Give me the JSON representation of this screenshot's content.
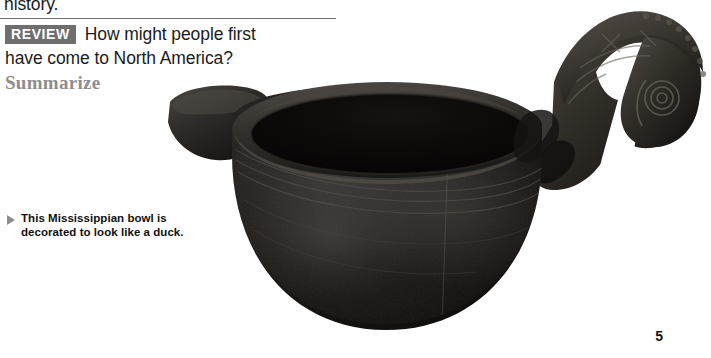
{
  "page": {
    "background_color": "#ffffff",
    "folio": "5"
  },
  "body_text": {
    "clipped_line": "history."
  },
  "review": {
    "badge_label": "REVIEW",
    "badge_bg": "#6e6e6e",
    "badge_text_color": "#ffffff",
    "question_line_1": "How might people first",
    "question_line_2": "have come to North America?",
    "skill_label": "Summarize",
    "skill_color": "#8e8e8e",
    "rule_color": "#6f6f6f"
  },
  "caption": {
    "marker": "triangle-right-icon",
    "marker_color": "#8d8d8d",
    "line_1": "This Mississippian bowl is",
    "line_2": "decorated to look like a duck."
  },
  "photo": {
    "subject": "mississippian-duck-effigy-bowl",
    "alt": "Dark ceramic Mississippian bowl with a carved duck head handle and a flat tail lug",
    "body_color": "#161616",
    "interior_color": "#0a0a0a",
    "rim_highlight_color": "#4a4a4a",
    "head_color": "#201f1e"
  }
}
